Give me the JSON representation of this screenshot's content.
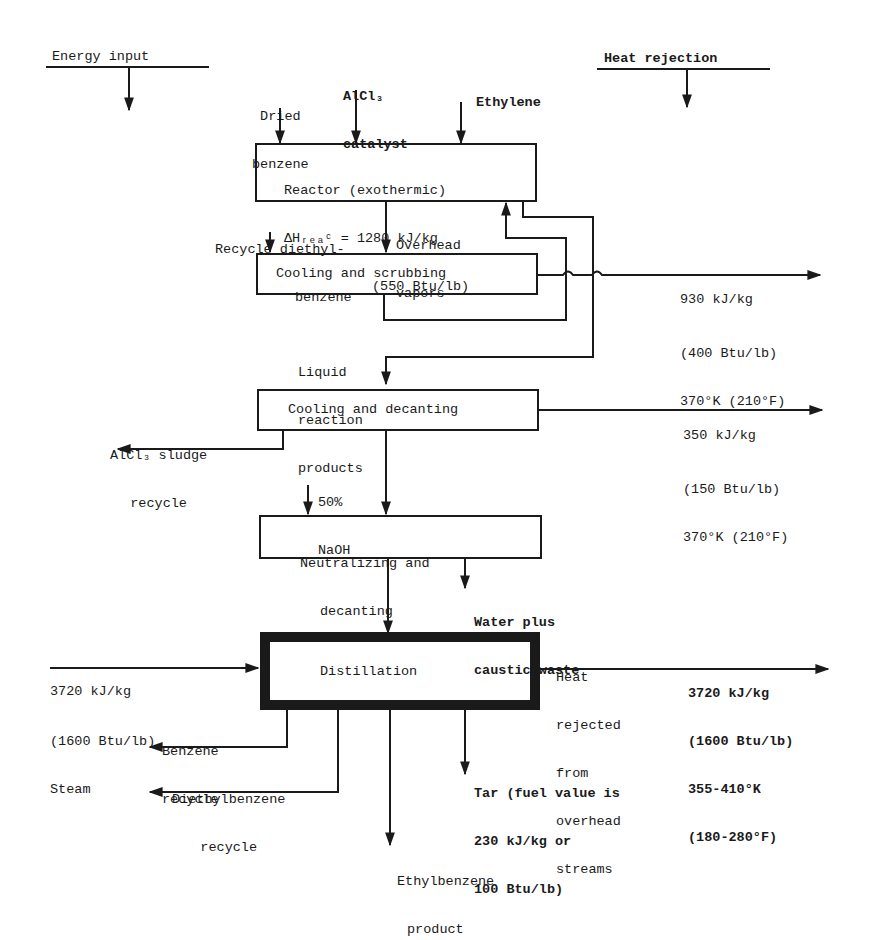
{
  "header": {
    "energy_input": "Energy input",
    "heat_rejection": "Heat rejection"
  },
  "inputs": {
    "dried_benzene": [
      "Dried",
      "benzene"
    ],
    "alcl3_catalyst": [
      "AlCl₃",
      "catalyst"
    ],
    "ethylene": "Ethylene",
    "recycle_diethylbenzene": [
      "Recycle diethyl-",
      "benzene"
    ],
    "naoh": [
      "50%",
      "NaOH"
    ]
  },
  "units": {
    "reactor": [
      "Reactor (exothermic)",
      "ΔHᵣₑₐᶜ = 1280 kJ/kg",
      "(550 Btu/lb)"
    ],
    "cooling_scrubbing": "Cooling and scrubbing",
    "cooling_decanting": "Cooling and decanting",
    "neutralizing": [
      "Neutralizing and",
      "decanting"
    ],
    "distillation": "Distillation"
  },
  "streams": {
    "overhead_vapors": [
      "Overhead",
      "vapors"
    ],
    "liquid_products": [
      "Liquid",
      "reaction",
      "products"
    ],
    "alcl3_sludge": [
      "AlCl₃ sludge",
      "recycle"
    ],
    "water_caustic": [
      "Water plus",
      "caustic waste"
    ],
    "steam": [
      "3720 kJ/kg",
      "(1600 Btu/lb)",
      "Steam"
    ],
    "heat_rejected_label": [
      "Heat",
      "rejected",
      "from",
      "overhead",
      "streams"
    ],
    "benzene_recycle": [
      "Benzene",
      "recycle"
    ],
    "deb_recycle": [
      "Diethylbenzene",
      "recycle"
    ],
    "tar": [
      "Tar (fuel value is",
      "230 kJ/kg or",
      "100 Btu/lb)"
    ],
    "product": [
      "Ethylbenzene",
      "product"
    ]
  },
  "heat_outputs": {
    "scrubbing": [
      "930 kJ/kg",
      "(400 Btu/lb)",
      "370°K (210°F)"
    ],
    "decanting": [
      "350 kJ/kg",
      "(150 Btu/lb)",
      "370°K (210°F)"
    ],
    "distillation": [
      "3720 kJ/kg",
      "(1600 Btu/lb)",
      "355-410°K",
      "(180-280°F)"
    ]
  },
  "colors": {
    "ink": "#1a1a1a",
    "background": "#ffffff"
  }
}
